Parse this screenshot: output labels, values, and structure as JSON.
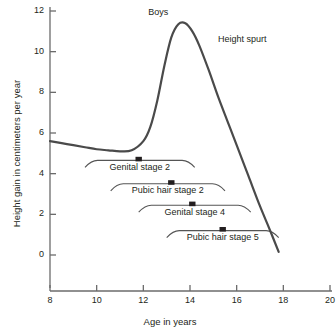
{
  "chart_data": {
    "type": "line",
    "title": "",
    "xlabel": "Age in years",
    "ylabel": "Height gain in centimeters per year",
    "xlim": [
      8,
      20
    ],
    "ylim": [
      0,
      12
    ],
    "xticks": [
      8,
      10,
      12,
      14,
      16,
      18,
      20
    ],
    "yticks": [
      0,
      2,
      4,
      6,
      8,
      10,
      12
    ],
    "grid": false,
    "legend": null,
    "series": [
      {
        "name": "Boys",
        "x": [
          8.0,
          8.5,
          9.0,
          9.5,
          10.0,
          10.5,
          11.0,
          11.5,
          12.0,
          12.3,
          12.6,
          12.9,
          13.2,
          13.5,
          13.8,
          14.1,
          14.4,
          14.8,
          15.2,
          15.6,
          16.0,
          16.5,
          17.0,
          17.4,
          17.8
        ],
        "y": [
          5.6,
          5.5,
          5.4,
          5.3,
          5.2,
          5.15,
          5.1,
          5.15,
          5.6,
          6.3,
          7.6,
          9.3,
          10.7,
          11.35,
          11.4,
          11.0,
          10.3,
          9.1,
          7.8,
          6.6,
          5.4,
          3.9,
          2.4,
          1.3,
          0.15
        ]
      }
    ],
    "annotations": [
      {
        "text": "Boys",
        "x": 13.5,
        "y": 11.95
      },
      {
        "text": "Height spurt",
        "x": 15.2,
        "y": 10.6
      }
    ],
    "stage_bars": [
      {
        "label": "Genital stage 2",
        "start": 9.5,
        "end": 14.2,
        "marker": 11.8,
        "y": 4.65
      },
      {
        "label": "Pubic hair stage 2",
        "start": 10.6,
        "end": 15.5,
        "marker": 13.2,
        "y": 3.5
      },
      {
        "label": "Genital stage 4",
        "start": 11.8,
        "end": 16.6,
        "marker": 14.1,
        "y": 2.45
      },
      {
        "label": "Pubic hair stage 5",
        "start": 13.0,
        "end": 17.8,
        "marker": 15.4,
        "y": 1.2
      }
    ],
    "colors": {
      "curve": "#4a4a4a",
      "axis": "#6b6b6b",
      "marker": "#231f20",
      "text": "#231f20",
      "background": "#ffffff"
    }
  }
}
